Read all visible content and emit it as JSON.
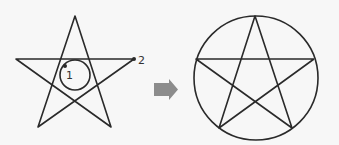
{
  "diagram": {
    "left_figure": {
      "type": "pentagram-with-loop",
      "star_points": [
        [
          75,
          16
        ],
        [
          16,
          59
        ],
        [
          134,
          59
        ],
        [
          38,
          127
        ],
        [
          111,
          127
        ]
      ],
      "loop_circle": {
        "cx": 75,
        "cy": 75,
        "r": 15
      },
      "markers": [
        {
          "id": "1",
          "label": "1",
          "x": 65,
          "y": 66,
          "label_x": 67,
          "label_y": 79
        },
        {
          "id": "2",
          "label": "2",
          "x": 134,
          "y": 59,
          "label_x": 139,
          "label_y": 63
        }
      ]
    },
    "arrow": {
      "direction": "right",
      "color": "#8c8c8c"
    },
    "right_figure": {
      "type": "pentagram-in-circle",
      "circle": {
        "cx": 255.5,
        "cy": 78,
        "r": 62
      },
      "star_points": [
        [
          255,
          16
        ],
        [
          196,
          59
        ],
        [
          314,
          59
        ],
        [
          219,
          128
        ],
        [
          292,
          128
        ]
      ]
    },
    "stroke_color": "#2a2a2a",
    "background": "#f7f7f7"
  }
}
